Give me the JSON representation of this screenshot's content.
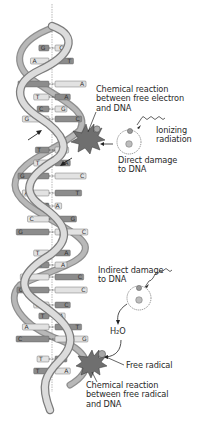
{
  "diagram": {
    "colors": {
      "backbone_light": "#d8d8d8",
      "backbone_dark": "#9a9a9a",
      "base_dark": "#8c8c8c",
      "base_light": "#e2e2e2",
      "damage_star": "#7a7a7a",
      "text": "#2a2a2a"
    },
    "labels": {
      "chem_reaction_electron": "Chemical reaction\nbetween free electron\nand DNA",
      "ionizing_radiation": "Ionizing\nradiation",
      "direct_damage": "Direct damage\nto DNA",
      "indirect_damage": "Indirect damage\nto DNA",
      "water": "H₂O",
      "free_radical": "Free radical",
      "chem_reaction_radical": "Chemical reaction\nbetween free radical\nand DNA"
    },
    "base_pairs": [
      {
        "left": "G",
        "right": "C",
        "y": 48
      },
      {
        "left": "A",
        "right": "T",
        "y": 61
      },
      {
        "left": "T",
        "right": "A",
        "y": 84
      },
      {
        "left": "T",
        "right": "A",
        "y": 97
      },
      {
        "left": "C",
        "right": "G",
        "y": 109
      },
      {
        "left": "G",
        "right": "C",
        "y": 119
      },
      {
        "left": "T",
        "right": "A",
        "y": 150
      },
      {
        "left": "T",
        "right": "A",
        "y": 163
      },
      {
        "left": "G",
        "right": "C",
        "y": 176
      },
      {
        "left": "A",
        "right": "T",
        "y": 193
      },
      {
        "left": "C",
        "right": "A",
        "y": 206
      },
      {
        "left": "C",
        "right": "G",
        "y": 219
      },
      {
        "left": "G",
        "right": "C",
        "y": 232
      },
      {
        "left": "T",
        "right": "A",
        "y": 253
      },
      {
        "left": "T",
        "right": "A",
        "y": 265
      },
      {
        "left": "G",
        "right": "C",
        "y": 277
      },
      {
        "left": "G",
        "right": "C",
        "y": 290
      },
      {
        "left": "G",
        "right": "C",
        "y": 305
      },
      {
        "left": "T",
        "right": "A",
        "y": 316
      },
      {
        "left": "A",
        "right": "T",
        "y": 327
      },
      {
        "left": "C",
        "right": "G",
        "y": 339
      },
      {
        "left": "T",
        "right": "A",
        "y": 359
      },
      {
        "left": "T",
        "right": "A",
        "y": 371
      }
    ]
  }
}
